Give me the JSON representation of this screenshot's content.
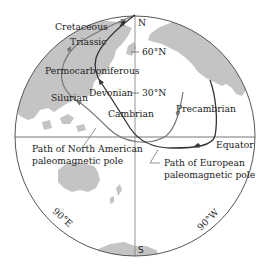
{
  "diagram": {
    "type": "polar-projection-globe",
    "poles": {
      "north": "N",
      "south": "S"
    },
    "latitude_ticks": [
      "60°N",
      "30°N"
    ],
    "equator_label": "Equator",
    "meridian_labels": [
      "90°E",
      "90°W"
    ],
    "period_labels": {
      "cretaceous": "Cretaceous",
      "triassic": "Triassic",
      "permocarboniferous": "Permocarboniferous",
      "devonian": "Devonian",
      "silurian": "Silurian",
      "cambrian": "Cambrian",
      "precambrian": "Precambrian"
    },
    "paths": [
      {
        "id": "north-american",
        "label_line1": "Path of North American",
        "label_line2": "paleomagnetic pole",
        "color": "#777777"
      },
      {
        "id": "european",
        "label_line1": "Path of European",
        "label_line2": "paleomagnetic pole",
        "color": "#333333"
      }
    ],
    "colors": {
      "land": "#c4c4c4",
      "outline": "#555555",
      "grid": "#888888",
      "background": "#ffffff"
    }
  }
}
